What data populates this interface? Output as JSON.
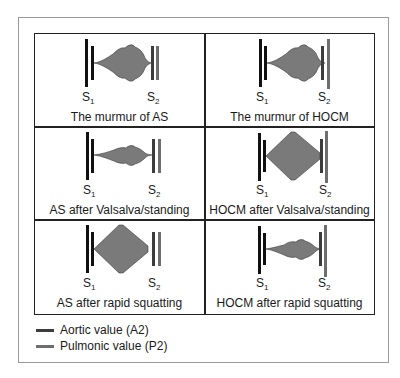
{
  "colors": {
    "s1": "#111111",
    "aortic": "#3c3c3c",
    "pulmonic": "#6e6e6e",
    "murmur_fill": "#7a7a7a",
    "murmur_stroke": "#3a3a3a"
  },
  "labels": {
    "s1_main": "S",
    "s1_sub": "1",
    "s2_main": "S",
    "s2_sub": "2"
  },
  "cells": [
    {
      "caption": "The murmur of AS",
      "shape": "AS crescendo-decrescendo, moderate"
    },
    {
      "caption": "The murmur of HOCM",
      "shape": "HOCM crescendo-decrescendo, moderate"
    },
    {
      "caption": "AS after Valsalva/standing",
      "shape": "AS decreased intensity"
    },
    {
      "caption": "HOCM after Valsalva/standing",
      "shape": "HOCM increased intensity"
    },
    {
      "caption": "AS after rapid squatting",
      "shape": "AS increased intensity"
    },
    {
      "caption": "HOCM after rapid squatting",
      "shape": "HOCM decreased intensity"
    }
  ],
  "legend": [
    {
      "label": "Aortic value (A2)",
      "color": "#3c3c3c"
    },
    {
      "label": "Pulmonic value (P2)",
      "color": "#6e6e6e"
    }
  ]
}
